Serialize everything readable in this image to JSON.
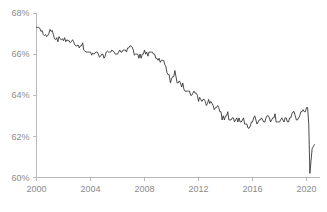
{
  "chart_data": {
    "type": "line",
    "title": "",
    "subtitle": "",
    "xlabel": "",
    "ylabel": "",
    "xlim": [
      2000.0,
      2021.0
    ],
    "ylim": [
      60,
      68
    ],
    "grid": false,
    "legend": null,
    "legend_position": "none",
    "y_tick_labels": [
      "68%",
      "66%",
      "64%",
      "62%",
      "60%"
    ],
    "y_tick_values": [
      68,
      66,
      64,
      62,
      60
    ],
    "x_tick_labels": [
      "2000",
      "2004",
      "2008",
      "2012",
      "2016",
      "2020"
    ],
    "x_tick_values": [
      2000,
      2004,
      2008,
      2012,
      2016,
      2020
    ],
    "line_color": "#2b2b2b",
    "axis_color": "#b9b9b9",
    "tick_label_color": "#8b8b8b",
    "series": [
      {
        "name": "Labor Force Participation Rate",
        "x": [
          2000.0,
          2000.083,
          2000.167,
          2000.25,
          2000.333,
          2000.417,
          2000.5,
          2000.583,
          2000.667,
          2000.75,
          2000.833,
          2000.917,
          2001.0,
          2001.083,
          2001.167,
          2001.25,
          2001.333,
          2001.417,
          2001.5,
          2001.583,
          2001.667,
          2001.75,
          2001.833,
          2001.917,
          2002.0,
          2002.083,
          2002.167,
          2002.25,
          2002.333,
          2002.417,
          2002.5,
          2002.583,
          2002.667,
          2002.75,
          2002.833,
          2002.917,
          2003.0,
          2003.083,
          2003.167,
          2003.25,
          2003.333,
          2003.417,
          2003.5,
          2003.583,
          2003.667,
          2003.75,
          2003.833,
          2003.917,
          2004.0,
          2004.083,
          2004.167,
          2004.25,
          2004.333,
          2004.417,
          2004.5,
          2004.583,
          2004.667,
          2004.75,
          2004.833,
          2004.917,
          2005.0,
          2005.083,
          2005.167,
          2005.25,
          2005.333,
          2005.417,
          2005.5,
          2005.583,
          2005.667,
          2005.75,
          2005.833,
          2005.917,
          2006.0,
          2006.083,
          2006.167,
          2006.25,
          2006.333,
          2006.417,
          2006.5,
          2006.583,
          2006.667,
          2006.75,
          2006.833,
          2006.917,
          2007.0,
          2007.083,
          2007.167,
          2007.25,
          2007.333,
          2007.417,
          2007.5,
          2007.583,
          2007.667,
          2007.75,
          2007.833,
          2007.917,
          2008.0,
          2008.083,
          2008.167,
          2008.25,
          2008.333,
          2008.417,
          2008.5,
          2008.583,
          2008.667,
          2008.75,
          2008.833,
          2008.917,
          2009.0,
          2009.083,
          2009.167,
          2009.25,
          2009.333,
          2009.417,
          2009.5,
          2009.583,
          2009.667,
          2009.75,
          2009.833,
          2009.917,
          2010.0,
          2010.083,
          2010.167,
          2010.25,
          2010.333,
          2010.417,
          2010.5,
          2010.583,
          2010.667,
          2010.75,
          2010.833,
          2010.917,
          2011.0,
          2011.083,
          2011.167,
          2011.25,
          2011.333,
          2011.417,
          2011.5,
          2011.583,
          2011.667,
          2011.75,
          2011.833,
          2011.917,
          2012.0,
          2012.083,
          2012.167,
          2012.25,
          2012.333,
          2012.417,
          2012.5,
          2012.583,
          2012.667,
          2012.75,
          2012.833,
          2012.917,
          2013.0,
          2013.083,
          2013.167,
          2013.25,
          2013.333,
          2013.417,
          2013.5,
          2013.583,
          2013.667,
          2013.75,
          2013.833,
          2013.917,
          2014.0,
          2014.083,
          2014.167,
          2014.25,
          2014.333,
          2014.417,
          2014.5,
          2014.583,
          2014.667,
          2014.75,
          2014.833,
          2014.917,
          2015.0,
          2015.083,
          2015.167,
          2015.25,
          2015.333,
          2015.417,
          2015.5,
          2015.583,
          2015.667,
          2015.75,
          2015.833,
          2015.917,
          2016.0,
          2016.083,
          2016.167,
          2016.25,
          2016.333,
          2016.417,
          2016.5,
          2016.583,
          2016.667,
          2016.75,
          2016.833,
          2016.917,
          2017.0,
          2017.083,
          2017.167,
          2017.25,
          2017.333,
          2017.417,
          2017.5,
          2017.583,
          2017.667,
          2017.75,
          2017.833,
          2017.917,
          2018.0,
          2018.083,
          2018.167,
          2018.25,
          2018.333,
          2018.417,
          2018.5,
          2018.583,
          2018.667,
          2018.75,
          2018.833,
          2018.917,
          2019.0,
          2019.083,
          2019.167,
          2019.25,
          2019.333,
          2019.417,
          2019.5,
          2019.583,
          2019.667,
          2019.75,
          2019.833,
          2019.917,
          2020.0,
          2020.083,
          2020.167,
          2020.25,
          2020.333,
          2020.417,
          2020.5,
          2020.583
        ],
        "values": [
          67.3,
          67.3,
          67.3,
          67.25,
          67.1,
          67.15,
          66.95,
          66.9,
          66.95,
          66.85,
          66.9,
          67.0,
          67.2,
          67.1,
          67.15,
          66.95,
          66.75,
          66.7,
          66.8,
          66.6,
          66.85,
          66.75,
          66.7,
          66.75,
          66.65,
          66.8,
          66.6,
          66.7,
          66.65,
          66.65,
          66.55,
          66.6,
          66.7,
          66.6,
          66.45,
          66.4,
          66.4,
          66.45,
          66.3,
          66.4,
          66.4,
          66.55,
          66.2,
          66.15,
          66.1,
          66.1,
          66.1,
          66.1,
          66.1,
          65.95,
          66.05,
          66.0,
          66.05,
          66.1,
          66.1,
          66.0,
          65.85,
          65.9,
          66.0,
          66.0,
          65.8,
          65.9,
          66.1,
          66.15,
          66.1,
          66.1,
          66.1,
          66.2,
          66.15,
          66.1,
          66.0,
          66.0,
          66.0,
          66.1,
          66.2,
          66.1,
          66.1,
          66.2,
          66.2,
          66.2,
          66.1,
          66.3,
          66.3,
          66.4,
          66.4,
          66.35,
          66.2,
          65.95,
          66.0,
          66.0,
          66.0,
          65.8,
          66.0,
          65.8,
          66.0,
          66.0,
          66.2,
          66.0,
          66.1,
          65.9,
          66.1,
          66.1,
          66.1,
          66.1,
          66.0,
          66.0,
          65.8,
          65.8,
          65.7,
          65.8,
          65.6,
          65.7,
          65.7,
          65.7,
          65.5,
          65.4,
          65.1,
          65.0,
          65.0,
          64.6,
          64.8,
          64.9,
          64.9,
          65.2,
          64.9,
          64.6,
          64.6,
          64.7,
          64.6,
          64.4,
          64.6,
          64.3,
          64.2,
          64.2,
          64.2,
          64.2,
          64.2,
          64.0,
          64.0,
          64.1,
          64.2,
          64.1,
          64.1,
          64.0,
          63.7,
          63.9,
          63.8,
          63.7,
          63.8,
          63.8,
          63.7,
          63.5,
          63.6,
          63.8,
          63.6,
          63.7,
          63.6,
          63.5,
          63.3,
          63.4,
          63.4,
          63.5,
          63.4,
          63.2,
          63.2,
          62.8,
          63.0,
          62.8,
          63.0,
          63.0,
          63.2,
          62.8,
          62.8,
          62.8,
          62.9,
          62.9,
          62.7,
          62.8,
          62.9,
          62.7,
          62.9,
          62.7,
          62.7,
          62.8,
          62.9,
          62.6,
          62.6,
          62.6,
          62.4,
          62.4,
          62.5,
          62.7,
          62.7,
          62.9,
          63.0,
          62.8,
          62.6,
          62.7,
          62.8,
          62.8,
          62.9,
          62.8,
          62.7,
          62.7,
          62.9,
          63.0,
          63.0,
          62.9,
          62.7,
          62.8,
          62.9,
          62.9,
          63.1,
          62.7,
          62.7,
          62.7,
          62.7,
          62.8,
          62.9,
          62.8,
          62.7,
          62.9,
          62.9,
          62.7,
          62.7,
          62.9,
          62.9,
          63.1,
          63.2,
          63.2,
          63.0,
          62.8,
          62.8,
          62.9,
          63.0,
          63.2,
          63.2,
          63.3,
          63.2,
          63.2,
          63.4,
          63.4,
          62.6,
          60.2,
          60.8,
          61.4,
          61.5,
          61.6
        ]
      }
    ]
  }
}
